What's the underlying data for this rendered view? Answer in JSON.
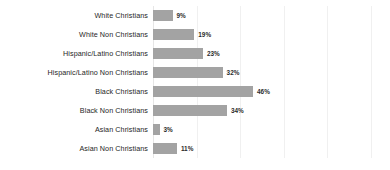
{
  "chart_data": {
    "type": "bar",
    "orientation": "horizontal",
    "title": "",
    "subtitle": "",
    "xlabel": "",
    "ylabel": "",
    "xlim": [
      0,
      108.5
    ],
    "grid": true,
    "gridlines_at": [
      0,
      20,
      40,
      60,
      80,
      100
    ],
    "legend": "none",
    "value_suffix": "%",
    "bar_color": "#a3a3a3",
    "gridline_color": "#f0f0f0",
    "text_color": "#262626",
    "background_color": "#ffffff",
    "categories": [
      "White Christians",
      "White Non Christians",
      "Hispanic/Latino Christians",
      "Hispanic/Latino Non Christians",
      "Black Christians",
      "Black Non Christians",
      "Asian Christians",
      "Asian Non Christians"
    ],
    "values": [
      9,
      19,
      23,
      32,
      46,
      34,
      3,
      11
    ],
    "data_labels": [
      "9%",
      "19%",
      "23%",
      "32%",
      "46%",
      "34%",
      "3%",
      "11%"
    ],
    "points": [
      {
        "category": "White Christians",
        "value": 9,
        "label": "9%"
      },
      {
        "category": "White Non Christians",
        "value": 19,
        "label": "19%"
      },
      {
        "category": "Hispanic/Latino Christians",
        "value": 23,
        "label": "23%"
      },
      {
        "category": "Hispanic/Latino Non Christians",
        "value": 32,
        "label": "32%"
      },
      {
        "category": "Black Christians",
        "value": 46,
        "label": "46%"
      },
      {
        "category": "Black Non Christians",
        "value": 34,
        "label": "34%"
      },
      {
        "category": "Asian Christians",
        "value": 3,
        "label": "3%"
      },
      {
        "category": "Asian Non Christians",
        "value": 11,
        "label": "11%"
      }
    ]
  }
}
